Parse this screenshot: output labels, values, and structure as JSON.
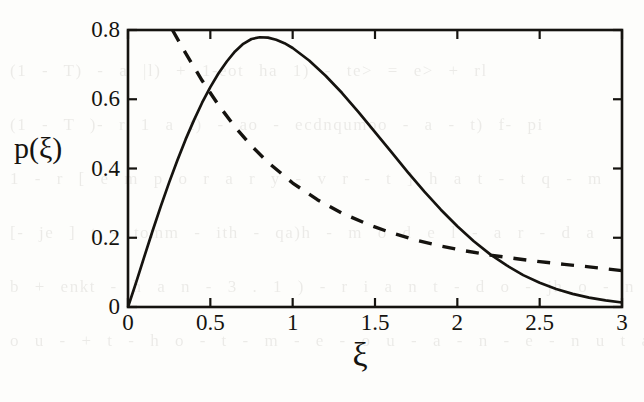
{
  "figure": {
    "background_color": "#fdfdfb",
    "ink_color": "#15130f",
    "bleed_through_lines": [
      "(1 - T) - a |l) + 1-eot ha 1) - te> = e> + rl",
      "(1 - T )- r 1 a t) - ao - ecdnqumoo - a - t) f- pi",
      "1 - r [ e m p o r a r y - v r - t ] h a t - t q - m",
      "[- je ] t - tomm - ith - qa)h - m o d e l - a r - d a",
      "b + enkt - h a n - 3 . 1 ) - r i a n t - d o - jh o - n",
      "o u - + t - h o - t - m - e - o u - a - n - e - n u t a h i o n"
    ]
  },
  "axes": {
    "x_label": "ξ",
    "y_label": "p(ξ)",
    "x_ticks": [
      "0",
      "0.5",
      "1",
      "1.5",
      "2",
      "2.5",
      "3"
    ],
    "y_ticks": [
      "0",
      "0.2",
      "0.4",
      "0.6",
      "0.8"
    ]
  },
  "chart_data": {
    "type": "line",
    "title": "",
    "xlabel": "ξ",
    "ylabel": "p(ξ)",
    "xlim": [
      0,
      3
    ],
    "ylim": [
      0,
      0.8
    ],
    "xticks": [
      0,
      0.5,
      1,
      1.5,
      2,
      2.5,
      3
    ],
    "yticks": [
      0,
      0.2,
      0.4,
      0.6,
      0.8
    ],
    "grid": false,
    "legend": "none",
    "frame": "box",
    "annotations": [
      "solid curve peaks at approximately p = 0.78 near ξ = 0.78",
      "dashed curve exits top of frame near ξ = 0.27 and decays to p ≈ 0.10 at ξ = 3",
      "curves cross near ξ ≈ 0.42 (p ≈ 0.64) and again near ξ ≈ 2.05 (p ≈ 0.19)"
    ],
    "series": [
      {
        "name": "solid",
        "style": "solid",
        "color": "#15130f",
        "x": [
          0.0,
          0.05,
          0.1,
          0.15,
          0.2,
          0.25,
          0.3,
          0.35,
          0.4,
          0.45,
          0.5,
          0.55,
          0.6,
          0.65,
          0.7,
          0.75,
          0.8,
          0.85,
          0.9,
          0.95,
          1.0,
          1.1,
          1.2,
          1.3,
          1.4,
          1.5,
          1.6,
          1.7,
          1.8,
          1.9,
          2.0,
          2.1,
          2.2,
          2.3,
          2.4,
          2.5,
          2.6,
          2.7,
          2.8,
          2.9,
          3.0
        ],
        "y": [
          0.0,
          0.072,
          0.147,
          0.221,
          0.292,
          0.36,
          0.424,
          0.484,
          0.539,
          0.59,
          0.635,
          0.675,
          0.709,
          0.738,
          0.76,
          0.774,
          0.779,
          0.778,
          0.772,
          0.762,
          0.748,
          0.712,
          0.668,
          0.618,
          0.563,
          0.505,
          0.447,
          0.389,
          0.333,
          0.281,
          0.233,
          0.19,
          0.152,
          0.12,
          0.092,
          0.07,
          0.052,
          0.038,
          0.027,
          0.019,
          0.013
        ]
      },
      {
        "name": "dashed",
        "style": "dashed",
        "color": "#15130f",
        "x": [
          0.27,
          0.35,
          0.45,
          0.55,
          0.65,
          0.75,
          0.85,
          1.0,
          1.15,
          1.3,
          1.45,
          1.6,
          1.75,
          1.9,
          2.05,
          2.2,
          2.35,
          2.5,
          2.65,
          2.8,
          3.0
        ],
        "y": [
          0.8,
          0.733,
          0.654,
          0.583,
          0.52,
          0.465,
          0.418,
          0.358,
          0.31,
          0.271,
          0.24,
          0.214,
          0.193,
          0.176,
          0.162,
          0.15,
          0.14,
          0.131,
          0.123,
          0.116,
          0.105
        ]
      }
    ]
  }
}
